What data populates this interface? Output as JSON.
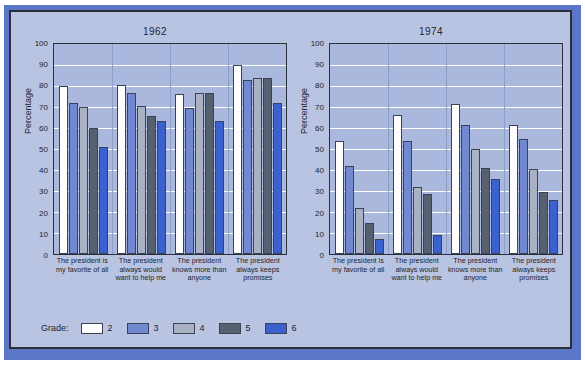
{
  "figure": {
    "legend_title": "Grade:",
    "background_color": "#b9c4e2",
    "plot_background_color": "#aab8dd",
    "border_color": "#2b2f3a",
    "band_color": "#5b76c6"
  },
  "chart_data": [
    {
      "type": "bar",
      "title": "1962",
      "xlabel": "",
      "ylabel": "Percentage",
      "ylim": [
        0,
        100
      ],
      "yticks": [
        0,
        10,
        20,
        30,
        40,
        50,
        60,
        70,
        80,
        90,
        100
      ],
      "grid": true,
      "legend_position": "bottom",
      "categories": [
        "The president is my favorite of all",
        "The president always would want to help me",
        "The president knows more than anyone",
        "The president always keeps promises"
      ],
      "series": [
        {
          "name": "2",
          "color": "#fdfdfd",
          "values": [
            80,
            80.5,
            76,
            90
          ]
        },
        {
          "name": "3",
          "color": "#7189d0",
          "values": [
            72,
            76.5,
            69.5,
            83
          ]
        },
        {
          "name": "4",
          "color": "#a9b1c2",
          "values": [
            70,
            70.5,
            76.5,
            84
          ]
        },
        {
          "name": "5",
          "color": "#56606f",
          "values": [
            60,
            65.5,
            76.5,
            84
          ]
        },
        {
          "name": "6",
          "color": "#3a61cd",
          "values": [
            51,
            63.5,
            63.5,
            72
          ]
        }
      ]
    },
    {
      "type": "bar",
      "title": "1974",
      "xlabel": "",
      "ylabel": "Percentage",
      "ylim": [
        0,
        100
      ],
      "yticks": [
        0,
        10,
        20,
        30,
        40,
        50,
        60,
        70,
        80,
        90,
        100
      ],
      "grid": true,
      "legend_position": "bottom",
      "categories": [
        "The president is my favorite of all",
        "The president always would want to help me",
        "The president knows more than anyone",
        "The president always keeps promises"
      ],
      "series": [
        {
          "name": "2",
          "color": "#fdfdfd",
          "values": [
            54,
            66,
            71.5,
            61.5
          ]
        },
        {
          "name": "3",
          "color": "#7189d0",
          "values": [
            42,
            54,
            61.5,
            55
          ]
        },
        {
          "name": "4",
          "color": "#a9b1c2",
          "values": [
            22,
            32,
            50,
            40.5
          ]
        },
        {
          "name": "5",
          "color": "#56606f",
          "values": [
            15,
            28.5,
            41,
            29.5
          ]
        },
        {
          "name": "6",
          "color": "#3a61cd",
          "values": [
            7,
            9,
            35.5,
            25.5
          ]
        }
      ]
    }
  ],
  "legend": [
    {
      "label": "2",
      "color": "#fdfdfd"
    },
    {
      "label": "3",
      "color": "#7189d0"
    },
    {
      "label": "4",
      "color": "#a9b1c2"
    },
    {
      "label": "5",
      "color": "#56606f"
    },
    {
      "label": "6",
      "color": "#3a61cd"
    }
  ]
}
